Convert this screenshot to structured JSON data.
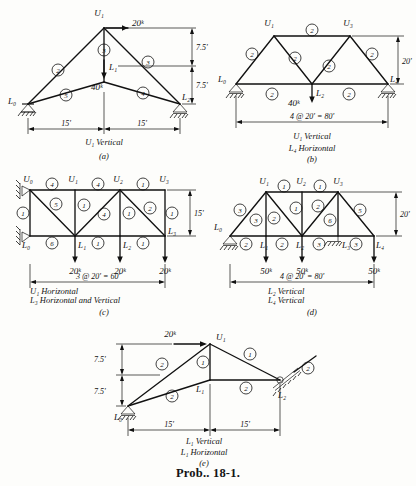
{
  "figure": {
    "problem_label": "Prob.. 18-1.",
    "background_color": "#fdfdfb",
    "ink_color": "#111111"
  },
  "panels": [
    {
      "id": "a",
      "caption_lines": [
        "U₁ Vertical"
      ],
      "panel_letter": "(a)",
      "joints": [
        "U₁",
        "L₀",
        "L₁",
        "L₂"
      ],
      "joint_labels": {
        "apex": "U₁",
        "left_support": "L₀",
        "center_bottom": "L₁",
        "right_support": "L₂"
      },
      "loads": [
        {
          "label": "20ᵏ",
          "direction": "horizontal-right",
          "at": "U₁"
        },
        {
          "label": "40ᵏ",
          "direction": "vertical-down",
          "at": "L₁"
        }
      ],
      "members": [
        "2",
        "3",
        "3",
        "5",
        "4"
      ],
      "dimensions": {
        "horizontal": [
          "15'",
          "15'"
        ],
        "vertical": [
          "7.5'",
          "7.5'"
        ]
      }
    },
    {
      "id": "b",
      "caption_lines": [
        "U₁ Vertical",
        "L₄ Horizontal"
      ],
      "panel_letter": "(b)",
      "joints": [
        "U₁",
        "U₃",
        "L₀",
        "L₂",
        "L₄"
      ],
      "loads": [
        {
          "label": "40ᵏ",
          "direction": "vertical-down",
          "at": "L₂"
        }
      ],
      "members": [
        "2",
        "2",
        "2",
        "2",
        "2",
        "2",
        "2",
        "2"
      ],
      "dimensions": {
        "span": "4 @ 20' = 80'",
        "height": "20'"
      }
    },
    {
      "id": "c",
      "caption_lines": [
        "U₁ Horizontal",
        "L₃ Horizontal and Vertical"
      ],
      "panel_letter": "(c)",
      "joints": [
        "U₀",
        "U₁",
        "U₂",
        "U₃",
        "L₀",
        "L₁",
        "L₂",
        "L₃"
      ],
      "loads": [
        {
          "label": "20ᵏ",
          "direction": "vertical-down",
          "at": "L₁"
        },
        {
          "label": "20ᵏ",
          "direction": "vertical-down",
          "at": "L₂"
        },
        {
          "label": "20ᵏ",
          "direction": "vertical-down",
          "at": "L₃"
        }
      ],
      "members": [
        "4",
        "4",
        "1",
        "1",
        "5",
        "1",
        "4",
        "1",
        "2",
        "1",
        "6",
        "1",
        "1"
      ],
      "dimensions": {
        "span": "3 @ 20' = 60'",
        "height": "15'"
      }
    },
    {
      "id": "d",
      "caption_lines": [
        "L₂ Vertical",
        "L₄ Vertical"
      ],
      "panel_letter": "(d)",
      "joints": [
        "U₁",
        "U₂",
        "U₃",
        "L₀",
        "L₁",
        "L₂",
        "L₃",
        "L₄"
      ],
      "loads": [
        {
          "label": "50ᵏ",
          "direction": "vertical-down",
          "at": "L₁"
        },
        {
          "label": "50ᵏ",
          "direction": "vertical-down",
          "at": "L₂"
        },
        {
          "label": "50ᵏ",
          "direction": "vertical-down",
          "at": "L₃"
        }
      ],
      "members": [
        "1",
        "1",
        "3",
        "3",
        "2",
        "1",
        "2",
        "6",
        "5",
        "2",
        "2",
        "3",
        "3"
      ],
      "dimensions": {
        "span": "4 @ 20' = 80'",
        "height": "20'"
      }
    },
    {
      "id": "e",
      "caption_lines": [
        "L₁ Vertical",
        "L₁ Horizontal"
      ],
      "panel_letter": "(e)",
      "joints": [
        "U₁",
        "L₀",
        "L₁",
        "L₂"
      ],
      "loads": [
        {
          "label": "20ᵏ",
          "direction": "horizontal-right",
          "at": "U₁"
        }
      ],
      "members": [
        "2",
        "1",
        "1",
        "2",
        "2",
        "2"
      ],
      "dimensions": {
        "horizontal": [
          "15'",
          "15'"
        ],
        "vertical": [
          "7.5'",
          "7.5'"
        ]
      }
    }
  ]
}
